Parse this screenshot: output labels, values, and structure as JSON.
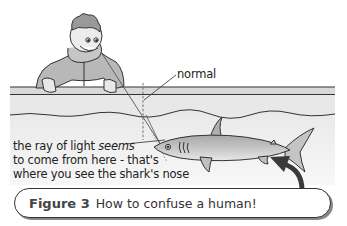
{
  "figure": {
    "number_label": "Figure 3",
    "caption": "How to confuse a human!"
  },
  "labels": {
    "normal": "normal",
    "ray_line1_prefix": "the ray of light ",
    "ray_line1_emph": "seems",
    "ray_line2": "to come from here - that's",
    "ray_line3": "where you see the shark's nose"
  },
  "colors": {
    "ink": "#333333",
    "water": "#e4e4e4",
    "tank_rim": "#d8d8d8",
    "shark": "#b9b9b9",
    "arrow": "#3a3a3a"
  }
}
